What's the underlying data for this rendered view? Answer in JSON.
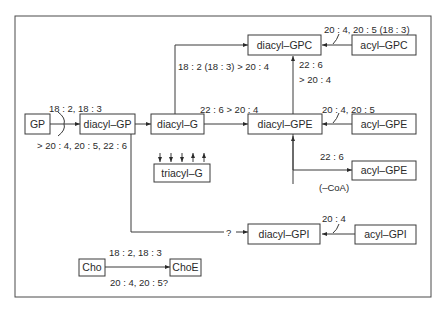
{
  "nodes": {
    "gp": "GP",
    "diacyl_gp": "diacyl–GP",
    "diacyl_g": "diacyl–G",
    "diacyl_gpc": "diacyl–GPC",
    "acyl_gpc": "acyl–GPC",
    "diacyl_gpe": "diacyl–GPE",
    "acyl_gpe_top": "acyl–GPE",
    "triacyl_g": "triacyl–G",
    "acyl_gpe_bottom": "acyl–GPE",
    "diacyl_gpi": "diacyl–GPI",
    "acyl_gpi": "acyl–GPI",
    "cho": "Cho",
    "choe": "ChoE"
  },
  "edges": {
    "gp_to_diacyl_gp_above": "18 : 2, 18 : 3",
    "gp_to_diacyl_gp_below": "> 20 : 4, 20 : 5, 22 : 6",
    "diacyl_g_to_gpc": "18 : 2 (18 : 3) > 20 : 4",
    "diacyl_g_to_gpe": "22 : 6 > 20 : 4",
    "acyl_gpc_to_diacyl_gpc": "20 : 4, 20 : 5 (18 : 3)",
    "gpe_to_gpc_line1": "22 : 6",
    "gpe_to_gpc_line2": "> 20 : 4",
    "acyl_gpe_to_diacyl_gpe": "20 : 4, 20 : 5",
    "gpe_to_acyl_gpe": "22 : 6",
    "coa_note": "(–CoA)",
    "to_gpi_unknown": "?",
    "acyl_gpi_to_diacyl_gpi": "20 : 4",
    "cho_to_choe_above": "18 : 2, 18 : 3",
    "cho_to_choe_below": "20 : 4, 20 : 5?"
  },
  "triacyl_arrows": [
    "down",
    "down",
    "down",
    "up",
    "up"
  ]
}
